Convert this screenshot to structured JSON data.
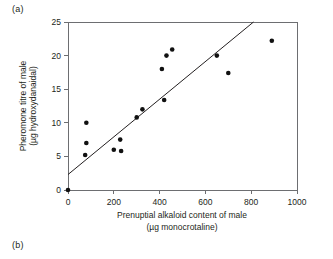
{
  "figure": {
    "panel_a_label": "(a)",
    "panel_b_label": "(b)"
  },
  "chart_data": {
    "type": "scatter",
    "title": "",
    "xlabel": "Prenuptial alkaloid content of male",
    "xlabel_units": "(µg monocrotaline)",
    "ylabel": "Pheromone titre of male",
    "ylabel_units": "(µg hydroxydanaidal)",
    "xlim": [
      0,
      1000
    ],
    "ylim": [
      0,
      25
    ],
    "xticks": [
      0,
      200,
      400,
      600,
      800,
      1000
    ],
    "xtick_labels": [
      "0",
      "200",
      "400",
      "600",
      "800",
      "1000"
    ],
    "yticks": [
      0,
      5,
      10,
      15,
      20,
      25
    ],
    "ytick_labels": [
      "0",
      "5",
      "10",
      "15",
      "20",
      "25"
    ],
    "grid": false,
    "legend": null,
    "marker": "filled-circle",
    "marker_color": "#111111",
    "points": [
      {
        "x": 0,
        "y": 0.0
      },
      {
        "x": 75,
        "y": 5.2
      },
      {
        "x": 80,
        "y": 7.0
      },
      {
        "x": 80,
        "y": 10.0
      },
      {
        "x": 200,
        "y": 6.0
      },
      {
        "x": 228,
        "y": 7.5
      },
      {
        "x": 232,
        "y": 5.8
      },
      {
        "x": 300,
        "y": 10.8
      },
      {
        "x": 325,
        "y": 12.0
      },
      {
        "x": 410,
        "y": 18.0
      },
      {
        "x": 420,
        "y": 13.4
      },
      {
        "x": 430,
        "y": 20.0
      },
      {
        "x": 455,
        "y": 20.9
      },
      {
        "x": 650,
        "y": 20.0
      },
      {
        "x": 700,
        "y": 17.4
      },
      {
        "x": 890,
        "y": 22.2
      }
    ],
    "fit_line": {
      "type": "linear-regression",
      "x_start": 0,
      "y_start": 2.3,
      "x_end": 810,
      "y_end": 25.0,
      "color": "#231f20"
    }
  }
}
